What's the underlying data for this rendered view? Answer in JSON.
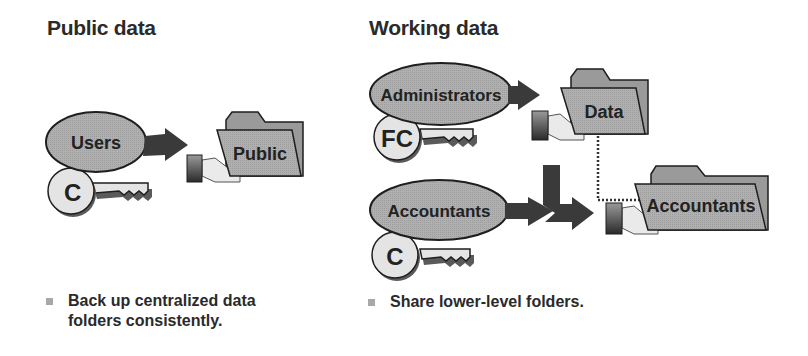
{
  "sections": {
    "public": {
      "heading": "Public data",
      "group_label": "Users",
      "permission_key": "C",
      "folder_label": "Public",
      "bullet": "Back up centralized data folders consistently."
    },
    "working": {
      "heading": "Working data",
      "groups": [
        {
          "label": "Administrators",
          "permission_key": "FC"
        },
        {
          "label": "Accountants",
          "permission_key": "C"
        }
      ],
      "folders": [
        {
          "label": "Data"
        },
        {
          "label": "Accountants"
        }
      ],
      "bullet": "Share lower-level folders."
    }
  },
  "colors": {
    "ellipse_fill": "#a9a9a9",
    "folder_front": "#c4c4c4",
    "folder_back": "#9a9a9a",
    "key_fill": "#e4e4e4",
    "arrow": "#3a3a3a",
    "outline": "#1e1e1e",
    "bullet_square": "#a8a8a8"
  }
}
